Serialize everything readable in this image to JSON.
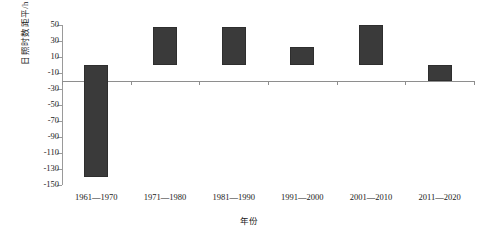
{
  "chart_data": {
    "type": "bar",
    "title": "",
    "subtitle": "",
    "xlabel": "年份",
    "ylabel": "日照时数距平/h",
    "categories": [
      "1961—1970",
      "1971—1980",
      "1981—1990",
      "1991—2000",
      "2001—2010",
      "2011—2020"
    ],
    "values": [
      -140,
      47,
      47,
      23,
      50,
      -20
    ],
    "series": [
      {
        "name": "日照时数距平",
        "values": [
          -140,
          47,
          47,
          23,
          50,
          -20
        ]
      }
    ],
    "ylim": [
      -150,
      50
    ],
    "ytick_step": 20,
    "yticks": [
      50,
      30,
      10,
      -10,
      -30,
      -50,
      -70,
      -90,
      -110,
      -130,
      -150
    ],
    "ytick_labels": [
      "50",
      "30",
      "10",
      "-10",
      "-30",
      "-50",
      "-70",
      "-90",
      "-110",
      "-130",
      "-150"
    ],
    "grid": false,
    "legend": false,
    "legend_position": "none",
    "bar_color": "#3a3a3a",
    "axis_color": "#8e8e8e",
    "zero_line": 0,
    "annotations": []
  }
}
